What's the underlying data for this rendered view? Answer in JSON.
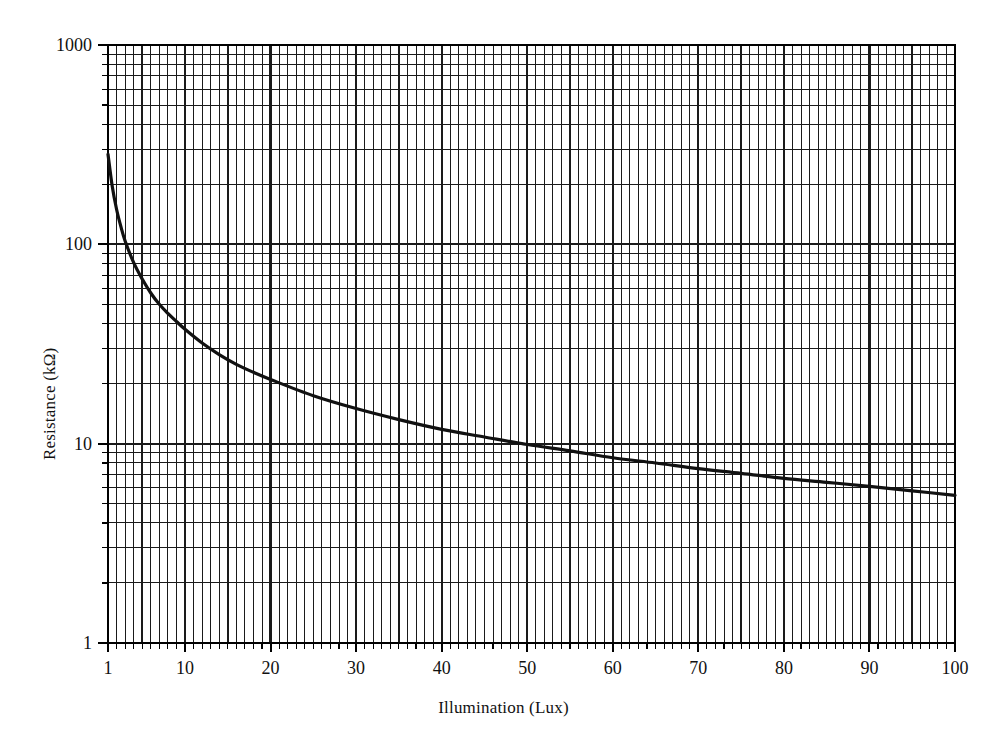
{
  "chart_data": {
    "type": "line",
    "title": "",
    "subtitle": "",
    "xlabel": "Illumination (Lux)",
    "ylabel": "Resistance (kΩ)",
    "xscale": "linear",
    "yscale": "log",
    "xlim": [
      1,
      100
    ],
    "ylim": [
      1,
      1000
    ],
    "grid": true,
    "grid_minor": true,
    "legend": null,
    "legend_position": "none",
    "x_tick_labels": [
      "1",
      "10",
      "20",
      "30",
      "40",
      "50",
      "60",
      "70",
      "80",
      "90",
      "100"
    ],
    "x_ticks": [
      1,
      10,
      20,
      30,
      40,
      50,
      60,
      70,
      80,
      90,
      100
    ],
    "x_minor_step": 1,
    "y_tick_labels": [
      "1",
      "10",
      "100",
      "1000"
    ],
    "y_ticks": [
      1,
      10,
      100,
      1000
    ],
    "y_minor_decade_multipliers": [
      2,
      3,
      4,
      5,
      6,
      7,
      8,
      9
    ],
    "series": [
      {
        "name": "Resistance vs Illumination",
        "color": "#111111",
        "line_width": 3.2,
        "x": [
          1,
          1.5,
          2,
          2.5,
          3,
          4,
          5,
          6,
          7,
          8,
          9,
          10,
          12,
          14,
          16,
          18,
          20,
          25,
          30,
          35,
          40,
          45,
          50,
          55,
          60,
          65,
          70,
          75,
          80,
          85,
          90,
          95,
          100
        ],
        "y": [
          283,
          195,
          150,
          123,
          104,
          81,
          67,
          57,
          50,
          45,
          41,
          37.5,
          32,
          28,
          25,
          22.8,
          21,
          17.4,
          15,
          13.2,
          11.8,
          10.8,
          9.9,
          9.2,
          8.5,
          8.0,
          7.5,
          7.1,
          6.7,
          6.4,
          6.1,
          5.8,
          5.5
        ]
      }
    ],
    "annotations": []
  },
  "plot": {
    "left_px": 108,
    "right_px": 955,
    "top_px": 45,
    "bottom_px": 643,
    "background": "#ffffff",
    "grid_color": "#1a1a1a",
    "axis_color": "#000000",
    "curve_color": "#111111"
  },
  "axes": {
    "x_title": "Illumination (Lux)",
    "y_title": "Resistance (kΩ)"
  }
}
